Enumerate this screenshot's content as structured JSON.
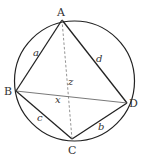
{
  "diagram": {
    "points": [
      {
        "name": "A"
      },
      {
        "name": "B"
      },
      {
        "name": "C"
      },
      {
        "name": "D"
      }
    ],
    "sides": [
      {
        "label": "a",
        "from": "A",
        "to": "B"
      },
      {
        "label": "d",
        "from": "A",
        "to": "D"
      },
      {
        "label": "c",
        "from": "B",
        "to": "C"
      },
      {
        "label": "b",
        "from": "C",
        "to": "D"
      }
    ],
    "diagonals": [
      {
        "label": "x",
        "from": "B",
        "to": "D",
        "style": "solid"
      },
      {
        "label": "z",
        "from": "A",
        "to": "C",
        "style": "dashed"
      }
    ],
    "colors": {
      "stroke": "#222222",
      "diagonal": "#555555",
      "text": "#333333"
    }
  }
}
